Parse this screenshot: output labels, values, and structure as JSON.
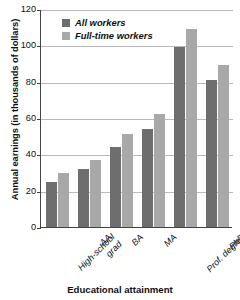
{
  "chart_data": {
    "type": "bar",
    "title": "",
    "xlabel": "Educational attainment",
    "ylabel": "Annual earnings (in thousands of dollars)",
    "categories": [
      "High-school\ngrad",
      "AA",
      "BA",
      "MA",
      "Prof. degree",
      "PhD"
    ],
    "series": [
      {
        "name": "All workers",
        "color": "#6e6e6e",
        "values": [
          25,
          32,
          44,
          54,
          99,
          81
        ]
      },
      {
        "name": "Full-time workers",
        "color": "#a8a8a8",
        "values": [
          30,
          37,
          51,
          62,
          109,
          89
        ]
      }
    ],
    "ylim": [
      0,
      120
    ],
    "yticks": [
      0,
      20,
      40,
      60,
      80,
      100,
      120
    ],
    "ytick_labels": [
      "0",
      "20",
      "40",
      "60",
      "80",
      "100",
      "120"
    ],
    "grid": true,
    "legend_position": "top-left"
  }
}
